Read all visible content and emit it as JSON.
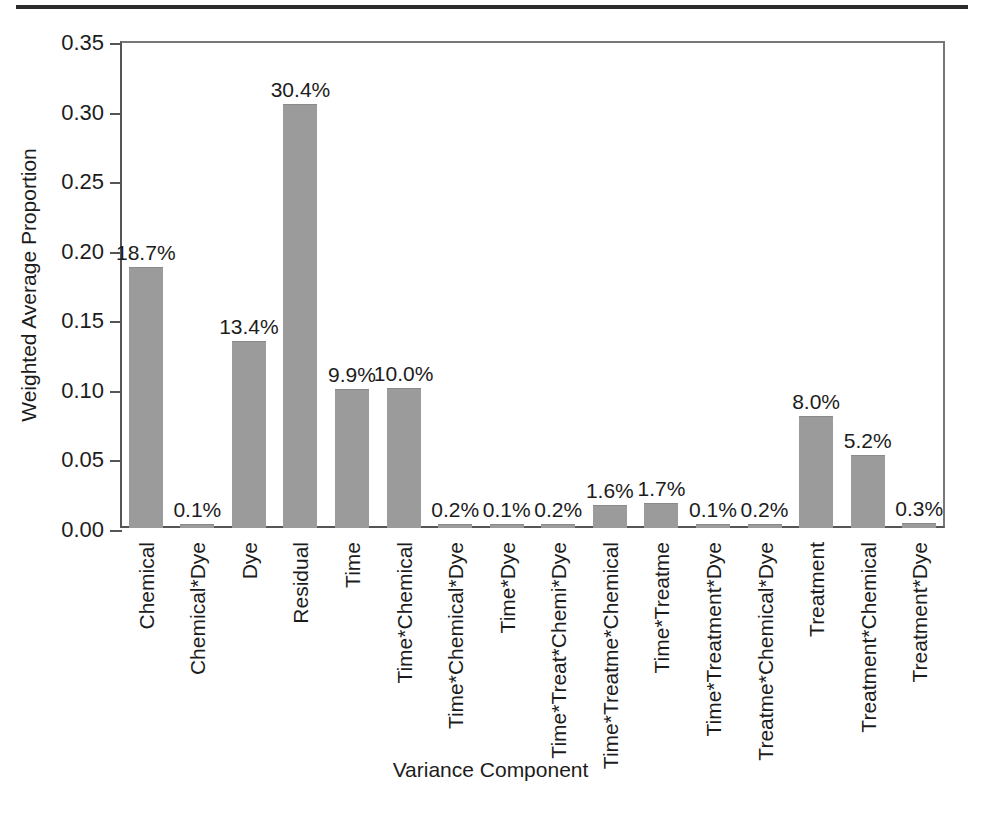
{
  "figure": {
    "top_rule": "",
    "bottom_caption": ""
  },
  "chart_data": {
    "type": "bar",
    "title": "",
    "xlabel": "Variance Component",
    "ylabel": "Weighted Average Proportion",
    "ylim": [
      0.0,
      0.35
    ],
    "ytick_labels": [
      "0.00",
      "0.05",
      "0.10",
      "0.15",
      "0.20",
      "0.25",
      "0.30",
      "0.35"
    ],
    "ytick_values": [
      0.0,
      0.05,
      0.1,
      0.15,
      0.2,
      0.25,
      0.3,
      0.35
    ],
    "grid": false,
    "legend": null,
    "bar_color": "#9b9b9b",
    "categories": [
      "Chemical",
      "Chemical*Dye",
      "Dye",
      "Residual",
      "Time",
      "Time*Chemical",
      "Time*Chemical*Dye",
      "Time*Dye",
      "Time*Treat*Chemi*Dye",
      "Time*Treatme*Chemical",
      "Time*Treatme",
      "Time*Treatment*Dye",
      "Treatme*Chemical*Dye",
      "Treatment",
      "Treatment*Chemical",
      "Treatment*Dye"
    ],
    "values": [
      0.187,
      0.001,
      0.134,
      0.304,
      0.099,
      0.1,
      0.002,
      0.001,
      0.002,
      0.016,
      0.017,
      0.001,
      0.002,
      0.08,
      0.052,
      0.003
    ],
    "data_labels": [
      "18.7%",
      "0.1%",
      "13.4%",
      "30.4%",
      "9.9%",
      "10.0%",
      "0.2%",
      "0.1%",
      "0.2%",
      "1.6%",
      "1.7%",
      "0.1%",
      "0.2%",
      "8.0%",
      "5.2%",
      "0.3%"
    ]
  }
}
